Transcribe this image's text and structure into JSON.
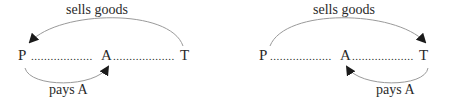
{
  "diagrams": [
    {
      "top_label": "sells goods",
      "bottom_label": "pays A",
      "nodes": {
        "left": "P",
        "middle": "A",
        "right": "T"
      },
      "dots": "..................."
    },
    {
      "top_label": "sells goods",
      "bottom_label": "pays A",
      "nodes": {
        "left": "P",
        "middle": "A",
        "right": "T"
      },
      "dots": "..................."
    }
  ],
  "colors": {
    "line": "#9a9a9a",
    "arrow": "#1a1a1a",
    "text": "#2a2a2a"
  }
}
